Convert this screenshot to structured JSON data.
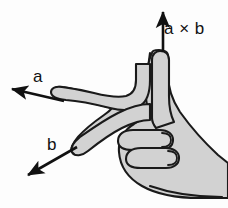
{
  "figure": {
    "background_color": "#fdfdfd",
    "width": 228,
    "height": 208
  },
  "hand": {
    "name": "right-hand",
    "fill_color": "#d2d2d2",
    "outline_color": "#1a1a1a",
    "description": "right hand with thumb up, index finger pointing up-left, middle finger pointing down-left, remaining fingers curled"
  },
  "vectors": [
    {
      "id": "a-cross-b",
      "label": "a × b",
      "direction": "up",
      "color": "#111111",
      "tail": [
        163,
        52
      ],
      "tip": [
        163,
        10
      ]
    },
    {
      "id": "a",
      "label": "a",
      "direction": "up-left",
      "color": "#111111",
      "tail": [
        64,
        101
      ],
      "tip": [
        9,
        88
      ]
    },
    {
      "id": "b",
      "label": "b",
      "direction": "down-left",
      "color": "#111111",
      "tail": [
        77,
        147
      ],
      "tip": [
        25,
        177
      ]
    }
  ],
  "labels": {
    "a_cross_b": "a × b",
    "a": "a",
    "b": "b"
  }
}
